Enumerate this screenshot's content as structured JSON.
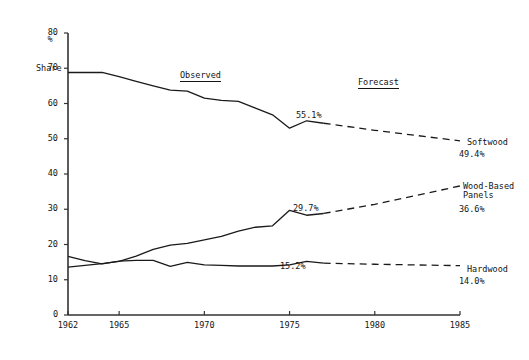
{
  "chart_data": {
    "type": "line",
    "title": "",
    "xlabel": "",
    "ylabel_line1": "%",
    "ylabel_line2": "Share",
    "xlim": [
      1962,
      1985
    ],
    "ylim": [
      0,
      80
    ],
    "grid": false,
    "legend_position": "right-inline",
    "y_ticks": [
      "0",
      "10",
      "20",
      "30",
      "40",
      "50",
      "60",
      "70",
      "80"
    ],
    "x_ticks": [
      "1962",
      "1965",
      "1970",
      "1975",
      "1980",
      "1985"
    ],
    "annotations": {
      "observed": "Observed",
      "forecast": "Forecast"
    },
    "series": [
      {
        "name": "Softwood",
        "end_value_label": "49.4%",
        "inline_value_label": "55.1%",
        "inline_value_year": 1976,
        "observed": {
          "x": [
            1962,
            1963,
            1964,
            1965,
            1966,
            1967,
            1968,
            1969,
            1970,
            1971,
            1972,
            1973,
            1974,
            1975,
            1976,
            1977
          ],
          "y": [
            68.8,
            68.8,
            68.8,
            67.6,
            66.3,
            65.0,
            63.8,
            63.5,
            61.5,
            60.9,
            60.6,
            58.7,
            56.8,
            53.0,
            55.1,
            54.4
          ]
        },
        "forecast": {
          "x": [
            1977,
            1980,
            1985
          ],
          "y": [
            54.4,
            52.4,
            49.4
          ]
        }
      },
      {
        "name": "Wood-Based Panels",
        "name_line1": "Wood-Based",
        "name_line2": "Panels",
        "end_value_label": "36.6%",
        "inline_value_label": "29.7%",
        "inline_value_year": 1975,
        "observed": {
          "x": [
            1962,
            1963,
            1964,
            1965,
            1966,
            1967,
            1968,
            1969,
            1970,
            1971,
            1972,
            1973,
            1974,
            1975,
            1976,
            1977
          ],
          "y": [
            13.6,
            14.1,
            14.6,
            15.2,
            16.7,
            18.6,
            19.8,
            20.3,
            21.3,
            22.3,
            23.8,
            24.9,
            25.3,
            29.7,
            28.3,
            28.8
          ]
        },
        "forecast": {
          "x": [
            1977,
            1980,
            1985
          ],
          "y": [
            28.8,
            31.4,
            36.6
          ]
        }
      },
      {
        "name": "Hardwood",
        "end_value_label": "14.0%",
        "inline_value_label": "15.2%",
        "inline_value_year": 1976,
        "observed": {
          "x": [
            1962,
            1963,
            1964,
            1965,
            1966,
            1967,
            1968,
            1969,
            1970,
            1971,
            1972,
            1973,
            1974,
            1975,
            1976,
            1977
          ],
          "y": [
            16.6,
            15.4,
            14.5,
            15.3,
            15.5,
            15.5,
            13.8,
            14.9,
            14.2,
            14.1,
            13.9,
            13.9,
            13.9,
            14.2,
            15.2,
            14.7
          ]
        },
        "forecast": {
          "x": [
            1977,
            1980,
            1985
          ],
          "y": [
            14.7,
            14.4,
            14.0
          ]
        }
      }
    ]
  }
}
